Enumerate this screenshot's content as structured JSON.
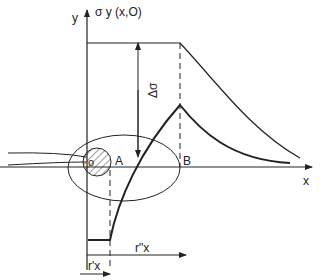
{
  "diagram": {
    "axis_labels": {
      "y": "y",
      "sigma": "σ y (x,O)",
      "x": "x",
      "delta_sigma": "Δσ"
    },
    "point_labels": {
      "origin": "o",
      "A": "A",
      "B": "B"
    },
    "dimension_labels": {
      "r_prime": "r'x",
      "r_double_prime": "r\"x"
    },
    "colors": {
      "line": "#222222",
      "background": "#ffffff"
    }
  }
}
